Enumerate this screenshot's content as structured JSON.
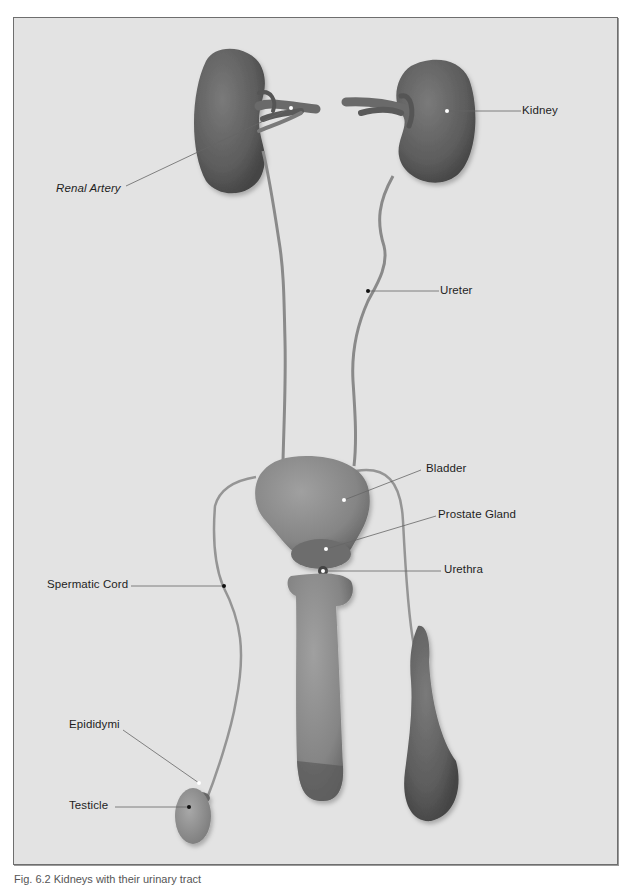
{
  "figure": {
    "background_color": "#e3e3e3",
    "frame_border_color": "#6e6e6e",
    "caption": "Fig. 6.2 Kidneys with their urinary tract"
  },
  "labels": {
    "kidney": "Kidney",
    "renal_artery": "Renal Artery",
    "ureter": "Ureter",
    "bladder": "Bladder",
    "prostate_gland": "Prostate Gland",
    "urethra": "Urethra",
    "spermatic_cord": "Spermatic Cord",
    "epididymi": "Epididymi",
    "testicle": "Testicle"
  }
}
